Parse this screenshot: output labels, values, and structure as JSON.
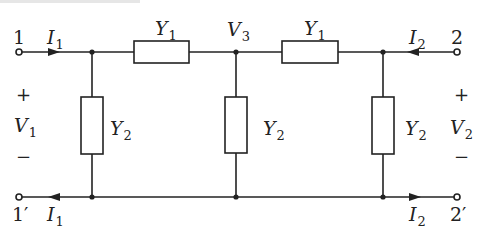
{
  "diagram": {
    "type": "two-port admittance network",
    "stroke_color": "#222222",
    "background": "#ffffff",
    "terminals": {
      "port1_top": "1",
      "port1_bottom": "1′",
      "port2_top": "2",
      "port2_bottom": "2′"
    },
    "currents": {
      "top_left": {
        "base": "I",
        "sub": "1"
      },
      "bottom_left": {
        "base": "I",
        "sub": "1"
      },
      "top_right": {
        "base": "I",
        "sub": "2"
      },
      "bottom_right": {
        "base": "I",
        "sub": "2"
      }
    },
    "voltages": {
      "v1": {
        "base": "V",
        "sub": "1",
        "plus": "+",
        "minus": "−"
      },
      "v2": {
        "base": "V",
        "sub": "2",
        "plus": "+",
        "minus": "−"
      },
      "v3": {
        "base": "V",
        "sub": "3"
      }
    },
    "admittances": {
      "series_left": {
        "base": "Y",
        "sub": "1"
      },
      "series_right": {
        "base": "Y",
        "sub": "1"
      },
      "shunt_left": {
        "base": "Y",
        "sub": "2"
      },
      "shunt_middle": {
        "base": "Y",
        "sub": "2"
      },
      "shunt_right": {
        "base": "Y",
        "sub": "2"
      }
    }
  }
}
